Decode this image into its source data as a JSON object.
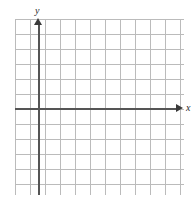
{
  "figure": {
    "type": "blank-cartesian-grid",
    "background_color": "#ffffff"
  },
  "grid": {
    "major_line_color": "#b0b0b0",
    "minor_line_color": "#c9c9c9",
    "major_spacing_px": 15,
    "minor_spacing_px": 3,
    "subdivisions_per_major": 5,
    "columns_major": 11,
    "rows_major": 11
  },
  "axes": {
    "color": "#555555",
    "arrow_color": "#3a3a3a",
    "origin_x_px": 38,
    "origin_y_px": 108,
    "x_label": "x",
    "y_label": "y",
    "x_arrow": "arrow-right",
    "y_arrow": "arrow-up"
  },
  "chart_data": {
    "type": "scatter",
    "title": "",
    "xlabel": "x",
    "ylabel": "y",
    "series": [],
    "x": [],
    "values": [],
    "xlim": [
      -1.5,
      9.5
    ],
    "ylim": [
      -5.5,
      5.5
    ],
    "grid": true,
    "legend": "none",
    "annotations": []
  }
}
